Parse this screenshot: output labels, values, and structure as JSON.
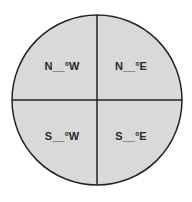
{
  "diagram": {
    "type": "quadrant-compass",
    "fill_color": "#d9d9d9",
    "stroke_color": "#222222",
    "quadrants": [
      {
        "id": "nw",
        "label": "N__°W"
      },
      {
        "id": "ne",
        "label": "N__°E"
      },
      {
        "id": "sw",
        "label": "S__°W"
      },
      {
        "id": "se",
        "label": "S__°E"
      }
    ]
  }
}
